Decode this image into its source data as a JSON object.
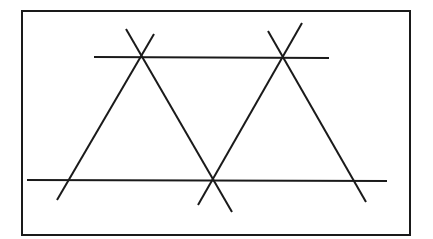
{
  "diagram": {
    "stroke_color": "#1a1a1a",
    "background": "#ffffff",
    "frame": {
      "x": 22,
      "y": 11,
      "width": 388,
      "height": 224,
      "stroke_width": 2
    },
    "horizontal_lines": [
      {
        "name": "top-horizontal-line",
        "x1": 94,
        "y1": 57,
        "x2": 329,
        "y2": 58
      },
      {
        "name": "bottom-horizontal-line",
        "x1": 27,
        "y1": 180,
        "x2": 387,
        "y2": 181
      }
    ],
    "slanted_lines": [
      {
        "name": "left-triangle-left-side",
        "x1": 154,
        "y1": 34,
        "x2": 57,
        "y2": 200
      },
      {
        "name": "left-triangle-right-side",
        "x1": 126,
        "y1": 29,
        "x2": 232,
        "y2": 212
      },
      {
        "name": "right-triangle-left-side",
        "x1": 302,
        "y1": 23,
        "x2": 198,
        "y2": 205
      },
      {
        "name": "right-triangle-right-side",
        "x1": 268,
        "y1": 31,
        "x2": 366,
        "y2": 202
      }
    ],
    "line_width": 2
  }
}
